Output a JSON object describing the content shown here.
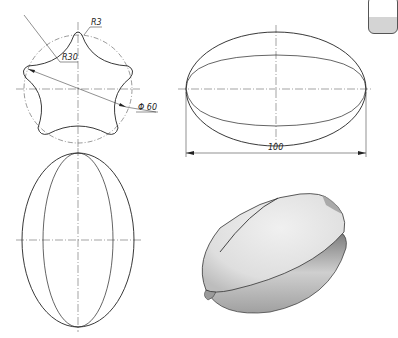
{
  "drawing": {
    "top_view": {
      "label_r3": "R3",
      "label_r30": "R30",
      "label_diameter": "Φ 60"
    },
    "front_view": {
      "label_length": "100"
    },
    "side_view": {},
    "iso_view": {}
  },
  "colors": {
    "line": "#222222",
    "centerline": "#555555",
    "shade_light": "#e6e6e6",
    "shade_dark": "#8a8a8a"
  }
}
